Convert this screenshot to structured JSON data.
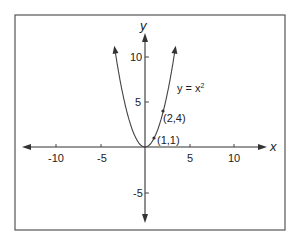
{
  "chart_data": {
    "type": "line",
    "title": "",
    "xlabel": "x",
    "ylabel": "y",
    "xlim": [
      -13.5,
      13.5
    ],
    "ylim": [
      -8,
      12.5
    ],
    "grid": false,
    "x_ticks": [
      -10,
      -5,
      5,
      10
    ],
    "y_ticks": [
      10,
      5,
      -5
    ],
    "series": [
      {
        "name": "y = x²",
        "equation": "y = x^2",
        "x_range": [
          -3.4,
          3.4
        ],
        "arrows_on_ends": true
      }
    ],
    "annotations": [
      {
        "text": "y = x²",
        "x": 3.9,
        "y": 6.8
      },
      {
        "text": "(2,4)",
        "point": [
          2,
          4
        ]
      },
      {
        "text": "(1,1)",
        "point": [
          1,
          1
        ]
      }
    ],
    "points": [
      [
        1,
        1
      ],
      [
        2,
        4
      ]
    ]
  },
  "labels": {
    "x_axis": "x",
    "y_axis": "y",
    "equation_main": "y = x",
    "equation_exp": "2",
    "point_2_4": "(2,4)",
    "point_1_1": "(1,1)",
    "tick_x_neg10": "-10",
    "tick_x_neg5": "-5",
    "tick_x_5": "5",
    "tick_x_10": "10",
    "tick_y_10": "10",
    "tick_y_5": "5",
    "tick_y_neg5": "-5"
  }
}
